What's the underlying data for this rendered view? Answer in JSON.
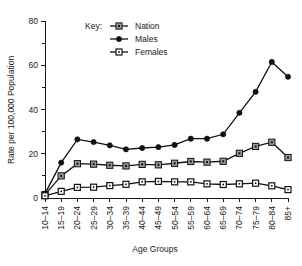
{
  "chart_data": {
    "type": "line",
    "title": "",
    "xlabel": "Age Groups",
    "ylabel": "Rate per 100,000 Population",
    "legend_title": "Key:",
    "legend_position": "top-center",
    "grid": false,
    "ylim": [
      0,
      80
    ],
    "yticks": [
      0,
      20,
      40,
      60,
      80
    ],
    "ytick_labels": [
      "0",
      "20",
      "40",
      "60",
      "80"
    ],
    "yminor_ticks": [
      10,
      30,
      50,
      70
    ],
    "categories": [
      "10–14",
      "15–19",
      "20–24",
      "25–29",
      "30–34",
      "35–39",
      "40–44",
      "45–49",
      "50–54",
      "55–59",
      "60–64",
      "65–69",
      "70–74",
      "75–79",
      "80–84",
      "85+"
    ],
    "series": [
      {
        "name": "Nation",
        "marker": "gray-square",
        "values": [
          1.5,
          10.0,
          15.5,
          15.3,
          14.8,
          14.5,
          15.2,
          15.0,
          15.7,
          16.5,
          16.2,
          16.6,
          20.2,
          23.3,
          25.2,
          18.3
        ]
      },
      {
        "name": "Males",
        "marker": "filled-circle",
        "values": [
          2.0,
          16.0,
          26.5,
          25.3,
          23.8,
          22.0,
          22.6,
          23.0,
          24.0,
          26.8,
          26.8,
          28.8,
          38.5,
          48.0,
          61.5,
          54.8
        ]
      },
      {
        "name": "Females",
        "marker": "open-square",
        "values": [
          1.0,
          3.0,
          4.8,
          4.9,
          5.6,
          6.2,
          7.3,
          7.5,
          7.3,
          7.3,
          6.4,
          6.1,
          6.4,
          6.7,
          5.5,
          3.8
        ]
      }
    ]
  },
  "legend": {
    "title": "Key:",
    "entries": [
      {
        "label": "Nation",
        "marker": "gray-square-marker"
      },
      {
        "label": "Males",
        "marker": "filled-circle-marker"
      },
      {
        "label": "Females",
        "marker": "open-square-marker"
      }
    ]
  },
  "colors": {
    "line": "#111111",
    "nation_marker_fill": "#9a9a9a",
    "females_marker_fill": "#ffffff",
    "males_marker_fill": "#111111",
    "axis": "#1a1a1a",
    "background": "#ffffff"
  }
}
